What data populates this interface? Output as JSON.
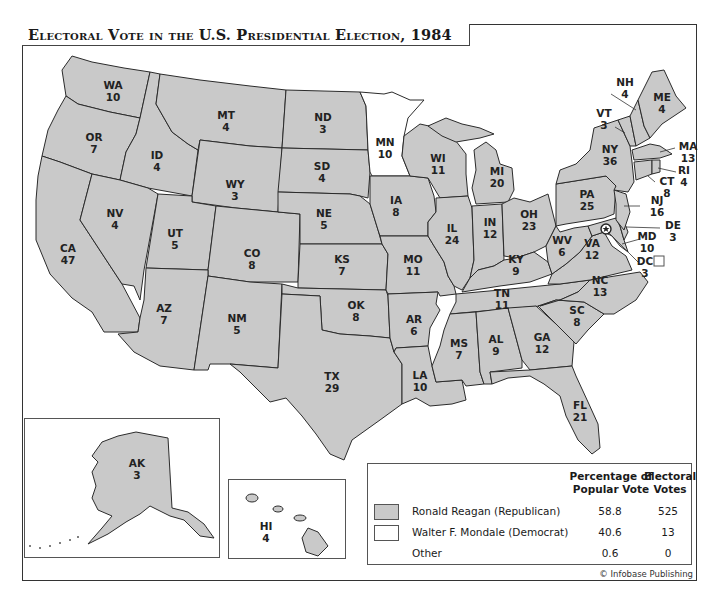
{
  "title": "Electoral Vote in the U.S. Presidential Election, 1984",
  "colors": {
    "republican": "#c9c9c9",
    "democrat": "#ffffff",
    "border": "#2b2b2b"
  },
  "states": {
    "WA": {
      "abbr": "WA",
      "ev": "10",
      "party": "R"
    },
    "OR": {
      "abbr": "OR",
      "ev": "7",
      "party": "R"
    },
    "CA": {
      "abbr": "CA",
      "ev": "47",
      "party": "R"
    },
    "ID": {
      "abbr": "ID",
      "ev": "4",
      "party": "R"
    },
    "NV": {
      "abbr": "NV",
      "ev": "4",
      "party": "R"
    },
    "MT": {
      "abbr": "MT",
      "ev": "4",
      "party": "R"
    },
    "WY": {
      "abbr": "WY",
      "ev": "3",
      "party": "R"
    },
    "UT": {
      "abbr": "UT",
      "ev": "5",
      "party": "R"
    },
    "AZ": {
      "abbr": "AZ",
      "ev": "7",
      "party": "R"
    },
    "CO": {
      "abbr": "CO",
      "ev": "8",
      "party": "R"
    },
    "NM": {
      "abbr": "NM",
      "ev": "5",
      "party": "R"
    },
    "ND": {
      "abbr": "ND",
      "ev": "3",
      "party": "R"
    },
    "SD": {
      "abbr": "SD",
      "ev": "4",
      "party": "R"
    },
    "NE": {
      "abbr": "NE",
      "ev": "5",
      "party": "R"
    },
    "KS": {
      "abbr": "KS",
      "ev": "7",
      "party": "R"
    },
    "OK": {
      "abbr": "OK",
      "ev": "8",
      "party": "R"
    },
    "TX": {
      "abbr": "TX",
      "ev": "29",
      "party": "R"
    },
    "MN": {
      "abbr": "MN",
      "ev": "10",
      "party": "D"
    },
    "IA": {
      "abbr": "IA",
      "ev": "8",
      "party": "R"
    },
    "MO": {
      "abbr": "MO",
      "ev": "11",
      "party": "R"
    },
    "AR": {
      "abbr": "AR",
      "ev": "6",
      "party": "R"
    },
    "LA": {
      "abbr": "LA",
      "ev": "10",
      "party": "R"
    },
    "WI": {
      "abbr": "WI",
      "ev": "11",
      "party": "R"
    },
    "IL": {
      "abbr": "IL",
      "ev": "24",
      "party": "R"
    },
    "MI": {
      "abbr": "MI",
      "ev": "20",
      "party": "R"
    },
    "IN": {
      "abbr": "IN",
      "ev": "12",
      "party": "R"
    },
    "OH": {
      "abbr": "OH",
      "ev": "23",
      "party": "R"
    },
    "KY": {
      "abbr": "KY",
      "ev": "9",
      "party": "R"
    },
    "TN": {
      "abbr": "TN",
      "ev": "11",
      "party": "R"
    },
    "MS": {
      "abbr": "MS",
      "ev": "7",
      "party": "R"
    },
    "AL": {
      "abbr": "AL",
      "ev": "9",
      "party": "R"
    },
    "GA": {
      "abbr": "GA",
      "ev": "12",
      "party": "R"
    },
    "FL": {
      "abbr": "FL",
      "ev": "21",
      "party": "R"
    },
    "SC": {
      "abbr": "SC",
      "ev": "8",
      "party": "R"
    },
    "NC": {
      "abbr": "NC",
      "ev": "13",
      "party": "R"
    },
    "VA": {
      "abbr": "VA",
      "ev": "12",
      "party": "R"
    },
    "WV": {
      "abbr": "WV",
      "ev": "6",
      "party": "R"
    },
    "PA": {
      "abbr": "PA",
      "ev": "25",
      "party": "R"
    },
    "NY": {
      "abbr": "NY",
      "ev": "36",
      "party": "R"
    },
    "NJ": {
      "abbr": "NJ",
      "ev": "16",
      "party": "R"
    },
    "DE": {
      "abbr": "DE",
      "ev": "3",
      "party": "R"
    },
    "MD": {
      "abbr": "MD",
      "ev": "10",
      "party": "R"
    },
    "DC": {
      "abbr": "DC",
      "ev": "3",
      "party": "D"
    },
    "VT": {
      "abbr": "VT",
      "ev": "3",
      "party": "R"
    },
    "NH": {
      "abbr": "NH",
      "ev": "4",
      "party": "R"
    },
    "ME": {
      "abbr": "ME",
      "ev": "4",
      "party": "R"
    },
    "MA": {
      "abbr": "MA",
      "ev": "13",
      "party": "R"
    },
    "RI": {
      "abbr": "RI",
      "ev": "4",
      "party": "R"
    },
    "CT": {
      "abbr": "CT",
      "ev": "8",
      "party": "R"
    },
    "AK": {
      "abbr": "AK",
      "ev": "3",
      "party": "R"
    },
    "HI": {
      "abbr": "HI",
      "ev": "4",
      "party": "R"
    }
  },
  "legend": {
    "col_pct": "Percentage of Popular Vote",
    "col_pct_line1": "Percentage of",
    "col_pct_line2": "Popular Vote",
    "col_ev_line1": "Electoral",
    "col_ev_line2": "Votes",
    "rows": [
      {
        "name": "Ronald Reagan (Republican)",
        "pct": "58.8",
        "ev": "525",
        "swatch": "#c9c9c9"
      },
      {
        "name": "Walter F. Mondale (Democrat)",
        "pct": "40.6",
        "ev": "13",
        "swatch": "#ffffff"
      },
      {
        "name": "Other",
        "pct": "0.6",
        "ev": "0",
        "swatch": null
      }
    ]
  },
  "credit": "© Infobase Publishing",
  "capital_marker": "star-in-circle"
}
